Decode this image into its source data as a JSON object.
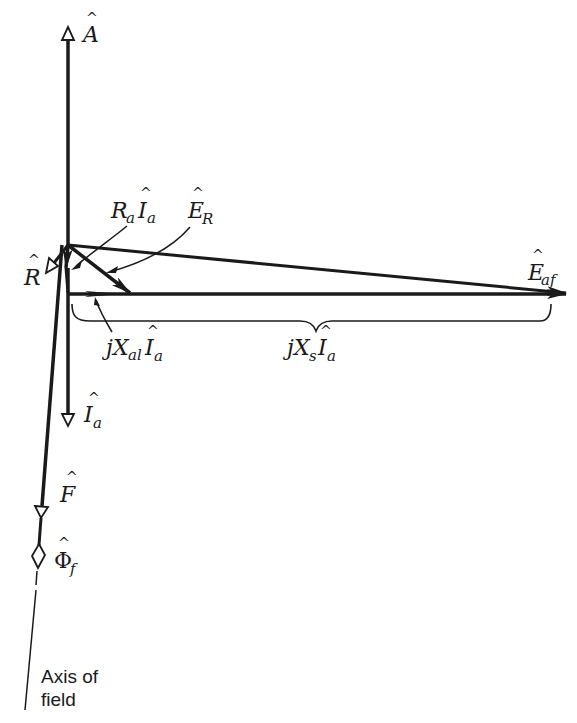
{
  "figure": {
    "background": "#ffffff",
    "ink": "#1a1a1a"
  },
  "labels": {
    "A": {
      "base": "A",
      "sub": "",
      "hat": "^"
    },
    "R": {
      "base": "R",
      "sub": "",
      "hat": "^"
    },
    "RaIa": {
      "coef": "R",
      "coef_sub": "a",
      "base": "I",
      "sub": "a",
      "hat": "^"
    },
    "ER": {
      "base": "E",
      "sub": "R",
      "hat": "^"
    },
    "Eaf": {
      "base": "E",
      "sub": "af",
      "hat": "^"
    },
    "jXalIa": {
      "prefix": "j",
      "coef": "X",
      "coef_sub": "al",
      "base": "I",
      "sub": "a",
      "hat": "^"
    },
    "jXsIa": {
      "prefix": "j",
      "coef": "X",
      "coef_sub": "s",
      "base": "I",
      "sub": "a",
      "hat": "^"
    },
    "Ia": {
      "base": "I",
      "sub": "a",
      "hat": "^"
    },
    "F": {
      "base": "F",
      "sub": "",
      "hat": "^"
    },
    "Phif": {
      "base": "Φ",
      "sub": "f",
      "hat": "^"
    },
    "axis_caption_line1": "Axis of",
    "axis_caption_line2": "field"
  },
  "vectors": [
    {
      "name": "A",
      "from": [
        68,
        245
      ],
      "to": [
        68,
        28
      ],
      "head": "open-triangle"
    },
    {
      "name": "R",
      "from": [
        68,
        245
      ],
      "to": [
        48,
        272
      ],
      "head": "open-triangle"
    },
    {
      "name": "RaIa",
      "from": [
        68,
        245
      ],
      "to": [
        66,
        268
      ],
      "head": "filled"
    },
    {
      "name": "ER",
      "from": [
        68,
        245
      ],
      "to": [
        130,
        293
      ],
      "head": "filled"
    },
    {
      "name": "Eaf",
      "from": [
        68,
        245
      ],
      "to": [
        566,
        294
      ],
      "head": "filled"
    },
    {
      "name": "jXalIa",
      "from": [
        66,
        268
      ],
      "to": [
        68,
        294
      ],
      "head": "filled"
    },
    {
      "name": "jXsIa",
      "from": [
        68,
        294
      ],
      "to": [
        566,
        294
      ],
      "head": "filled"
    },
    {
      "name": "Ia",
      "from": [
        68,
        245
      ],
      "to": [
        68,
        425
      ],
      "head": "open-triangle"
    },
    {
      "name": "F",
      "from": [
        60,
        245
      ],
      "to": [
        41,
        517
      ],
      "head": "open-triangle"
    },
    {
      "name": "Phif",
      "from": [
        41,
        517
      ],
      "to": [
        38,
        560
      ],
      "head": "open-diamond"
    }
  ]
}
